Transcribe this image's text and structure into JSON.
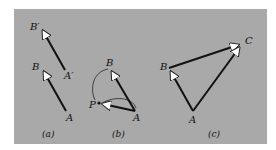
{
  "figure": {
    "background_color": "#a9a9a9",
    "line_color": "#111111",
    "arrowhead_color": "#ffffff"
  },
  "panels": [
    {
      "caption": "(a)",
      "labels": {
        "b_prime": "B′",
        "a_prime": "A′",
        "b": "B",
        "a": "A"
      },
      "vectors": [
        {
          "from": "A′",
          "to": "B′"
        },
        {
          "from": "A",
          "to": "B"
        }
      ]
    },
    {
      "caption": "(b)",
      "labels": {
        "b": "B",
        "p": "P",
        "a": "A"
      },
      "vectors": [
        {
          "from": "A",
          "to": "B"
        },
        {
          "from": "A",
          "to": "P"
        }
      ],
      "arcs": [
        "B to P (curved)",
        "P to A (curved)"
      ]
    },
    {
      "caption": "(c)",
      "labels": {
        "b": "B",
        "c": "C",
        "a": "A"
      },
      "vectors": [
        {
          "from": "A",
          "to": "B"
        },
        {
          "from": "B",
          "to": "C"
        },
        {
          "from": "A",
          "to": "C"
        }
      ]
    }
  ]
}
